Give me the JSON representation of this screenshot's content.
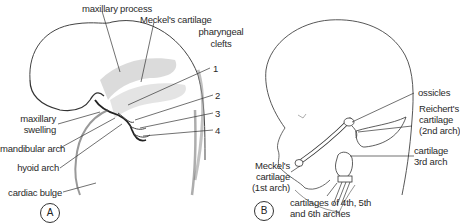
{
  "panels": {
    "a": {
      "badge": "A",
      "labels": {
        "maxillary_process": "maxillary process",
        "meckels_cartilage": "Meckel's cartilage",
        "pharyngeal_clefts_1": "pharyngeal",
        "pharyngeal_clefts_2": "clefts",
        "cleft_1": "1",
        "cleft_2": "2",
        "cleft_3": "3",
        "cleft_4": "4",
        "maxillary_swelling_1": "maxillary",
        "maxillary_swelling_2": "swelling",
        "mandibular_arch": "mandibular arch",
        "hyoid_arch": "hyoid arch",
        "cardiac_bulge": "cardiac bulge"
      }
    },
    "b": {
      "badge": "B",
      "labels": {
        "ossicles": "ossicles",
        "reicherts_1": "Reichert's",
        "reicherts_2": "cartilage",
        "reicherts_3": "(2nd arch)",
        "cartilage_3rd_1": "cartilage",
        "cartilage_3rd_2": "3rd  arch",
        "meckels_1": "Meckel's",
        "meckels_2": "cartilage",
        "meckels_3": "(1st arch)",
        "cartilages_456_1": "cartilages of 4th, 5th",
        "cartilages_456_2": "and 6th arches"
      }
    }
  },
  "colors": {
    "line": "#2a2a2a",
    "shade": "#c8c8c8",
    "background": "#ffffff"
  }
}
